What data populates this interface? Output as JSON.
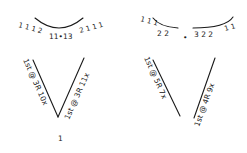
{
  "diagrams": [
    {
      "name": "left-neckline",
      "top": {
        "left_ticks": "1 1 1 2",
        "center": "11•13",
        "right_ticks": "2 1 1 1"
      },
      "left_edge_label": "1st @ 3R 10x",
      "right_edge_label": "1st @ 3R 11x",
      "bottom_label": "1"
    },
    {
      "name": "right-neckline",
      "top": {
        "left_ticks": "1 1 1",
        "center_left": "2 2",
        "center_dot": "•",
        "center_right": "3 2 2",
        "right_ticks": "1 1"
      },
      "left_edge_label": "1st @ 5R 7x",
      "right_edge_label": "1st @ 4R 9x"
    }
  ],
  "colors": {
    "ink": "#1a1a1a",
    "paper": "#ffffff"
  }
}
